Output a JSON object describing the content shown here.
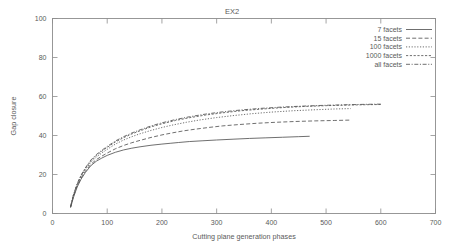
{
  "chart_data": {
    "type": "line",
    "title": "EX2",
    "xlabel": "Cutting plane generation phases",
    "ylabel": "Gap closure",
    "xlim": [
      0,
      700
    ],
    "ylim": [
      0,
      100
    ],
    "xticks": [
      0,
      100,
      200,
      300,
      400,
      500,
      600,
      700
    ],
    "yticks": [
      0,
      20,
      40,
      60,
      80,
      100
    ],
    "grid": false,
    "legend_position": "top-right",
    "series": [
      {
        "name": "7 facets",
        "linestyle": "solid",
        "x": [
          33,
          38,
          45,
          52,
          60,
          70,
          80,
          90,
          100,
          115,
          130,
          145,
          160,
          180,
          200,
          215,
          230,
          250,
          275,
          300,
          330,
          360,
          390,
          420,
          450,
          470
        ],
        "y": [
          3.0,
          8.0,
          13.5,
          17.5,
          21.0,
          24.5,
          26.8,
          28.4,
          29.8,
          31.4,
          32.6,
          33.5,
          34.2,
          35.0,
          35.6,
          36.0,
          36.4,
          36.9,
          37.3,
          37.7,
          38.1,
          38.5,
          38.8,
          39.1,
          39.4,
          39.6
        ]
      },
      {
        "name": "15 facets",
        "linestyle": "dashed",
        "x": [
          33,
          38,
          45,
          52,
          60,
          70,
          80,
          90,
          100,
          115,
          130,
          145,
          160,
          180,
          200,
          220,
          240,
          260,
          285,
          310,
          340,
          375,
          410,
          445,
          480,
          515,
          545
        ],
        "y": [
          3.2,
          8.5,
          14.0,
          18.0,
          21.6,
          25.2,
          27.6,
          29.4,
          31.0,
          33.2,
          34.9,
          36.3,
          37.5,
          39.0,
          40.3,
          41.4,
          42.4,
          43.2,
          44.1,
          44.9,
          45.6,
          46.3,
          46.8,
          47.2,
          47.5,
          47.7,
          47.9
        ]
      },
      {
        "name": "100 facets",
        "linestyle": "dotted",
        "x": [
          33,
          38,
          45,
          52,
          60,
          70,
          80,
          90,
          100,
          115,
          130,
          145,
          160,
          180,
          200,
          220,
          245,
          270,
          300,
          330,
          365,
          400,
          440,
          480,
          515,
          545
        ],
        "y": [
          3.4,
          9.0,
          14.6,
          18.8,
          22.5,
          26.3,
          28.9,
          31.0,
          32.9,
          35.6,
          37.7,
          39.4,
          40.9,
          42.6,
          44.1,
          45.4,
          46.8,
          48.0,
          49.2,
          50.2,
          51.2,
          52.0,
          52.7,
          53.2,
          53.6,
          53.8
        ]
      },
      {
        "name": "1000 facets",
        "linestyle": "fine-dashed",
        "x": [
          33,
          38,
          45,
          52,
          60,
          70,
          80,
          90,
          100,
          115,
          130,
          145,
          160,
          180,
          200,
          225,
          250,
          280,
          310,
          345,
          380,
          420,
          460,
          500,
          540,
          575,
          600
        ],
        "y": [
          3.5,
          9.2,
          15.0,
          19.3,
          23.1,
          27.0,
          29.7,
          31.9,
          33.9,
          36.7,
          38.9,
          40.8,
          42.4,
          44.4,
          46.0,
          47.7,
          49.1,
          50.5,
          51.6,
          52.7,
          53.5,
          54.3,
          54.9,
          55.3,
          55.6,
          55.8,
          55.9
        ]
      },
      {
        "name": "all facets",
        "linestyle": "dash-dot",
        "x": [
          33,
          38,
          45,
          52,
          60,
          70,
          80,
          90,
          100,
          115,
          130,
          145,
          160,
          180,
          200,
          225,
          250,
          280,
          310,
          345,
          380,
          420,
          460,
          500,
          540,
          575,
          600
        ],
        "y": [
          3.6,
          9.4,
          15.2,
          19.6,
          23.4,
          27.4,
          30.2,
          32.4,
          34.4,
          37.2,
          39.4,
          41.3,
          42.9,
          44.9,
          46.5,
          48.2,
          49.6,
          51.0,
          52.1,
          53.1,
          53.9,
          54.6,
          55.1,
          55.5,
          55.8,
          56.0,
          56.1
        ]
      }
    ]
  },
  "legend": {
    "entries": [
      {
        "label": "7 facets"
      },
      {
        "label": "15 facets"
      },
      {
        "label": "100 facets"
      },
      {
        "label": "1000 facets"
      },
      {
        "label": "all facets"
      }
    ]
  }
}
